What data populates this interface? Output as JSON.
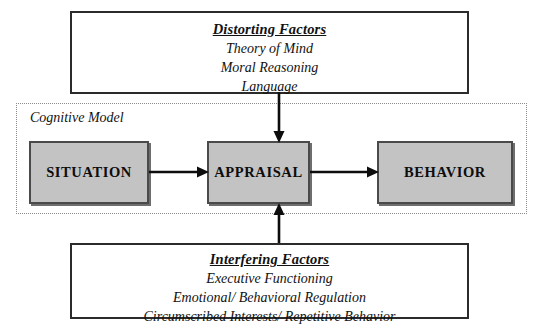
{
  "diagram": {
    "colors": {
      "node_fill": "#c3c3c3",
      "node_border": "#4a4a4a",
      "box_border": "#2b2b2b",
      "dotted_border": "#8a8a8a",
      "text": "#111111",
      "background": "#ffffff"
    }
  },
  "distorting_factors": {
    "title": "Distorting Factors",
    "items": [
      "Theory of Mind",
      "Moral Reasoning",
      "Language"
    ]
  },
  "interfering_factors": {
    "title": "Interfering Factors",
    "items": [
      "Executive Functioning",
      "Emotional/ Behavioral Regulation",
      "Circumscribed Interests/ Repetitive Behavior"
    ]
  },
  "cognitive_model": {
    "label": "Cognitive Model",
    "nodes": [
      {
        "id": "situation",
        "label": "SITUATION"
      },
      {
        "id": "appraisal",
        "label": "APPRAISAL"
      },
      {
        "id": "behavior",
        "label": "BEHAVIOR"
      }
    ]
  },
  "arrows": [
    {
      "id": "situation-to-appraisal",
      "from": "SITUATION",
      "to": "APPRAISAL",
      "direction": "right"
    },
    {
      "id": "appraisal-to-behavior",
      "from": "APPRAISAL",
      "to": "BEHAVIOR",
      "direction": "right"
    },
    {
      "id": "distorting-to-appraisal",
      "from": "Distorting Factors",
      "to": "APPRAISAL",
      "direction": "down"
    },
    {
      "id": "interfering-to-appraisal",
      "from": "Interfering Factors",
      "to": "APPRAISAL",
      "direction": "up"
    }
  ]
}
